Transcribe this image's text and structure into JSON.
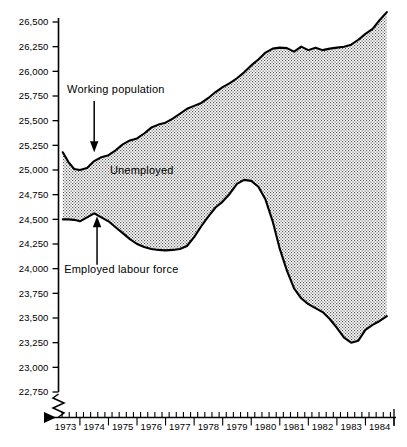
{
  "chart_data": {
    "type": "area",
    "title": "",
    "subtitle": "",
    "xlabel": "",
    "ylabel": "",
    "grid": false,
    "legend_position": "inline-annotations",
    "xlim": [
      1972.75,
      1984.5
    ],
    "ylim": [
      22750,
      26600
    ],
    "y_axis_break": true,
    "y_tick_labels": [
      "26,500",
      "26,250",
      "26,000",
      "25,750",
      "25,500",
      "25,250",
      "25,000",
      "24,750",
      "24,500",
      "24,250",
      "24,000",
      "23,750",
      "23,500",
      "23,250",
      "23,000",
      "22,750"
    ],
    "y_tick_values": [
      26500,
      26250,
      26000,
      25750,
      25500,
      25250,
      25000,
      24750,
      24500,
      24250,
      24000,
      23750,
      23500,
      23250,
      23000,
      22750
    ],
    "x_tick_labels": [
      "1973",
      "1974",
      "1975",
      "1976",
      "1977",
      "1978",
      "1979",
      "1980",
      "1981",
      "1982",
      "1983",
      "1984"
    ],
    "x_tick_values": [
      1973,
      1974,
      1975,
      1976,
      1977,
      1978,
      1979,
      1980,
      1981,
      1982,
      1983,
      1984
    ],
    "x_minor_ticks_per_year": 4,
    "annotations": [
      {
        "text": "Working population",
        "target_series": "Working population",
        "arrow": "down",
        "text_x": 1973.05,
        "text_y": 25780,
        "arrow_x": 1974.0,
        "arrow_from_y": 25700,
        "arrow_to_y": 25180
      },
      {
        "text": "Unemployed",
        "target_series": "Unemployed",
        "arrow": "none",
        "text_x": 1974.55,
        "text_y": 24960
      },
      {
        "text": "Employed labour force",
        "target_series": "Employed labour force",
        "arrow": "up",
        "text_x": 1972.95,
        "text_y": 23960,
        "arrow_x": 1974.1,
        "arrow_from_y": 24040,
        "arrow_to_y": 24530
      }
    ],
    "series": [
      {
        "name": "Working population",
        "role": "upper-boundary",
        "x": [
          1972.9,
          1973.1,
          1973.3,
          1973.5,
          1973.75,
          1974.0,
          1974.25,
          1974.5,
          1974.75,
          1975.0,
          1975.25,
          1975.5,
          1975.75,
          1976.0,
          1976.25,
          1976.5,
          1976.75,
          1977.0,
          1977.25,
          1977.5,
          1977.75,
          1978.0,
          1978.25,
          1978.5,
          1978.75,
          1979.0,
          1979.25,
          1979.5,
          1979.75,
          1980.0,
          1980.25,
          1980.5,
          1980.75,
          1981.0,
          1981.25,
          1981.5,
          1981.75,
          1982.0,
          1982.25,
          1982.5,
          1982.75,
          1983.0,
          1983.25,
          1983.5,
          1983.75,
          1984.0,
          1984.25
        ],
        "values": [
          25180,
          25080,
          25010,
          25000,
          25020,
          25090,
          25130,
          25150,
          25200,
          25260,
          25300,
          25320,
          25370,
          25430,
          25460,
          25480,
          25520,
          25570,
          25620,
          25650,
          25680,
          25730,
          25790,
          25840,
          25880,
          25930,
          25990,
          26060,
          26120,
          26190,
          26230,
          26240,
          26235,
          26200,
          26250,
          26215,
          26240,
          26215,
          26230,
          26240,
          26250,
          26270,
          26320,
          26380,
          26430,
          26520,
          26600
        ]
      },
      {
        "name": "Employed labour force",
        "role": "lower-boundary",
        "x": [
          1972.9,
          1973.1,
          1973.3,
          1973.5,
          1973.75,
          1974.0,
          1974.25,
          1974.5,
          1974.75,
          1975.0,
          1975.25,
          1975.5,
          1975.75,
          1976.0,
          1976.25,
          1976.5,
          1976.75,
          1977.0,
          1977.25,
          1977.5,
          1977.75,
          1978.0,
          1978.25,
          1978.5,
          1978.75,
          1979.0,
          1979.25,
          1979.5,
          1979.75,
          1980.0,
          1980.25,
          1980.5,
          1980.75,
          1981.0,
          1981.25,
          1981.5,
          1981.75,
          1982.0,
          1982.25,
          1982.5,
          1982.75,
          1983.0,
          1983.25,
          1983.5,
          1983.75,
          1984.0,
          1984.25
        ],
        "values": [
          24500,
          24500,
          24495,
          24480,
          24520,
          24560,
          24520,
          24480,
          24420,
          24360,
          24300,
          24250,
          24220,
          24200,
          24190,
          24185,
          24190,
          24200,
          24230,
          24320,
          24430,
          24530,
          24620,
          24680,
          24760,
          24860,
          24900,
          24890,
          24830,
          24700,
          24480,
          24200,
          23980,
          23800,
          23700,
          23640,
          23600,
          23560,
          23490,
          23400,
          23300,
          23250,
          23270,
          23380,
          23430,
          23470,
          23520
        ]
      },
      {
        "name": "Unemployed",
        "role": "shaded-band-between-boundaries",
        "description": "Vertical gap between Working population and Employed labour force"
      }
    ]
  },
  "annotations_text": {
    "working_population": "Working population",
    "unemployed": "Unemployed",
    "employed_labour_force": "Employed labour force"
  },
  "colors": {
    "line": "#000000",
    "band_fill": "#cfcfcf",
    "background": "#ffffff",
    "text": "#000000"
  }
}
